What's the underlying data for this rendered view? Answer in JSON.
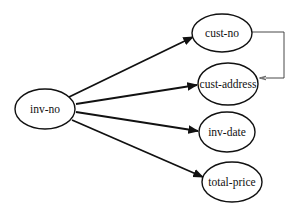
{
  "diagram": {
    "type": "functional-dependency",
    "source": {
      "id": "inv-no",
      "label": "inv-no",
      "cx": 45,
      "cy": 109,
      "rx": 30,
      "ry": 20
    },
    "targets": [
      {
        "id": "cust-no",
        "label": "cust-no",
        "cx": 222,
        "cy": 33,
        "rx": 30,
        "ry": 19
      },
      {
        "id": "cust-address",
        "label": "cust-address",
        "cx": 228,
        "cy": 84,
        "rx": 30,
        "ry": 21
      },
      {
        "id": "inv-date",
        "label": "inv-date",
        "cx": 227,
        "cy": 132,
        "rx": 28,
        "ry": 20
      },
      {
        "id": "total-price",
        "label": "total-price",
        "cx": 232,
        "cy": 182,
        "rx": 30,
        "ry": 20
      }
    ],
    "edges": [
      {
        "from": "inv-no",
        "to": "cust-no",
        "x1": 69,
        "y1": 97,
        "x2": 193,
        "y2": 37
      },
      {
        "from": "inv-no",
        "to": "cust-address",
        "x1": 76,
        "y1": 104,
        "x2": 197,
        "y2": 85
      },
      {
        "from": "inv-no",
        "to": "inv-date",
        "x1": 76,
        "y1": 112,
        "x2": 198,
        "y2": 131
      },
      {
        "from": "inv-no",
        "to": "total-price",
        "x1": 72,
        "y1": 120,
        "x2": 203,
        "y2": 177
      }
    ],
    "transitive_edge": {
      "from": "cust-no",
      "to": "cust-address",
      "path": "M252,32 L284,32 L284,78 L260,78"
    },
    "colors": {
      "stroke": "#111111",
      "background": "#ffffff"
    }
  }
}
